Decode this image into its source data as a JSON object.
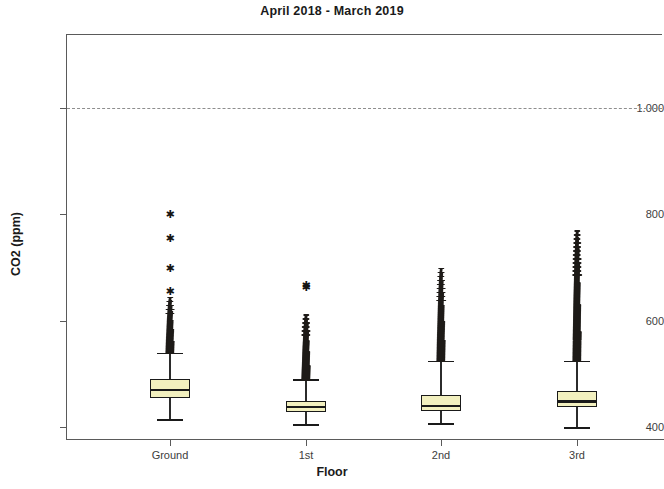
{
  "chart_data": {
    "type": "box",
    "title": "April 2018 - March 2019",
    "xlabel": "Floor",
    "ylabel": "CO2 (ppm)",
    "categories": [
      "Ground",
      "1st",
      "2nd",
      "3rd"
    ],
    "ytick_labels": [
      "1.000",
      "800",
      "600",
      "400"
    ],
    "ytick_values": [
      1000,
      800,
      600,
      400
    ],
    "ylim": [
      365,
      1130
    ],
    "grid": false,
    "legend": null,
    "reference_line": {
      "value": 1000,
      "style": "dashed",
      "color": "#8e8e8e"
    },
    "box_fill_color": "#f2f0bf",
    "box_line_color": "#1a1a1a",
    "outlier_marker": "star",
    "series": [
      {
        "name": "Ground",
        "whisker_low": 415,
        "q1": 455,
        "median": 470,
        "q3": 490,
        "whisker_high": 540,
        "outlier_top": 800,
        "isolated_outliers": [
          800,
          755,
          700,
          655
        ],
        "dense_outlier_range": [
          540,
          645
        ]
      },
      {
        "name": "1st",
        "whisker_low": 405,
        "q1": 428,
        "median": 437,
        "q3": 448,
        "whisker_high": 490,
        "outlier_top": 668,
        "isolated_outliers": [
          668,
          663
        ],
        "dense_outlier_range": [
          490,
          612
        ]
      },
      {
        "name": "2nd",
        "whisker_low": 408,
        "q1": 430,
        "median": 440,
        "q3": 460,
        "whisker_high": 525,
        "outlier_top": 700,
        "isolated_outliers": [],
        "dense_outlier_range": [
          525,
          700
        ]
      },
      {
        "name": "3rd",
        "whisker_low": 400,
        "q1": 438,
        "median": 448,
        "q3": 468,
        "whisker_high": 525,
        "outlier_top": 770,
        "isolated_outliers": [],
        "dense_outlier_range": [
          525,
          770
        ]
      }
    ]
  }
}
